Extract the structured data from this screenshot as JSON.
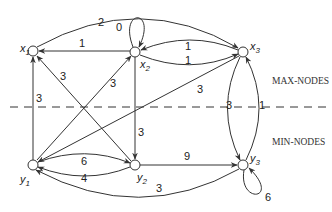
{
  "diagram": {
    "type": "directed-graph",
    "regions": {
      "top_label": "MAX-NODES",
      "bottom_label": "MIN-NODES"
    },
    "nodes": [
      {
        "id": "x1",
        "name": "x",
        "sub": "1",
        "group": "max"
      },
      {
        "id": "x2",
        "name": "x",
        "sub": "2",
        "group": "max"
      },
      {
        "id": "x3",
        "name": "x",
        "sub": "3",
        "group": "max"
      },
      {
        "id": "y1",
        "name": "y",
        "sub": "1",
        "group": "min"
      },
      {
        "id": "y2",
        "name": "y",
        "sub": "2",
        "group": "min"
      },
      {
        "id": "y3",
        "name": "y",
        "sub": "3",
        "group": "min"
      }
    ],
    "edges": [
      {
        "from": "x1",
        "to": "x3",
        "weight": "2"
      },
      {
        "from": "x2",
        "to": "x2",
        "weight": "0"
      },
      {
        "from": "x2",
        "to": "x1",
        "weight": "1"
      },
      {
        "from": "x3",
        "to": "x2",
        "weight": "1"
      },
      {
        "from": "x2",
        "to": "x3",
        "weight": "1"
      },
      {
        "from": "y2",
        "to": "x1",
        "weight": "3"
      },
      {
        "from": "y1",
        "to": "x2",
        "weight": "3"
      },
      {
        "from": "y1",
        "to": "x1",
        "weight": "3"
      },
      {
        "from": "x3",
        "to": "y1",
        "weight": "3"
      },
      {
        "from": "x2",
        "to": "y2",
        "weight": "3"
      },
      {
        "from": "x3",
        "to": "y3",
        "weight": "3"
      },
      {
        "from": "y3",
        "to": "x3",
        "weight": "1"
      },
      {
        "from": "y1",
        "to": "y2",
        "weight": "6"
      },
      {
        "from": "y2",
        "to": "y1",
        "weight": "4"
      },
      {
        "from": "y2",
        "to": "y3",
        "weight": "9"
      },
      {
        "from": "y3",
        "to": "y1",
        "weight": "3"
      },
      {
        "from": "y3",
        "to": "y3",
        "weight": "6"
      }
    ]
  }
}
